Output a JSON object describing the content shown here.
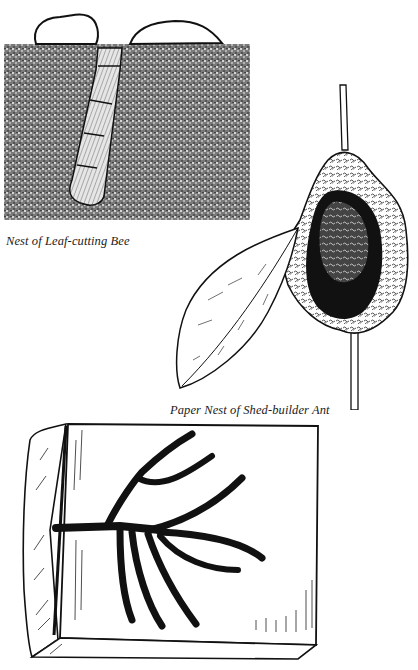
{
  "figures": [
    {
      "id": "leaf-cutting-bee-nest",
      "caption": "Nest of Leaf-cutting Bee",
      "illustration": "stipple-soil-cross-section-with-leaf-lined-burrow-under-two-stones"
    },
    {
      "id": "shed-builder-ant-nest",
      "caption": "Paper Nest of Shed-builder Ant",
      "illustration": "paper-nest-on-plant-stem-with-leaf"
    },
    {
      "id": "branching-tunnels",
      "caption": "",
      "illustration": "branching-gallery-engraved-on-wood-block"
    }
  ],
  "colors": {
    "ink": "#111111",
    "paper": "#ffffff"
  }
}
